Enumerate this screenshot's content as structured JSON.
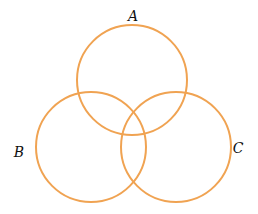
{
  "diagram": {
    "type": "venn",
    "stroke_color": "#F0A352",
    "sets": [
      {
        "id": "A",
        "label": "A"
      },
      {
        "id": "B",
        "label": "B"
      },
      {
        "id": "C",
        "label": "C"
      }
    ]
  }
}
